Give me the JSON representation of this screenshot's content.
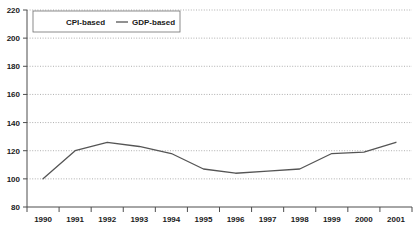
{
  "chart_data": {
    "type": "line",
    "title": "",
    "subtitle": "",
    "xlabel": "",
    "ylabel": "",
    "categories": [
      "1990",
      "1991",
      "1992",
      "1993",
      "1994",
      "1995",
      "1996",
      "1997",
      "1998",
      "1999",
      "2000",
      "2001"
    ],
    "x": [
      1990,
      1991,
      1992,
      1993,
      1994,
      1995,
      1996,
      1997,
      1998,
      1999,
      2000,
      2001
    ],
    "series": [
      {
        "name": "CPI-based",
        "color": "#ffffff",
        "visible_in_plot": false,
        "values": [
          null,
          null,
          null,
          null,
          null,
          null,
          null,
          null,
          null,
          null,
          null,
          null
        ]
      },
      {
        "name": "GDP-based",
        "color": "#555555",
        "visible_in_plot": true,
        "values": [
          100,
          120,
          126,
          123,
          118,
          107,
          104,
          105.5,
          107,
          118,
          119,
          126
        ]
      }
    ],
    "ylim": [
      80,
      220
    ],
    "yticks": [
      80,
      100,
      120,
      140,
      160,
      180,
      200,
      220
    ],
    "ytick_labels": [
      "80",
      "100",
      "120",
      "140",
      "160",
      "180",
      "200",
      "220"
    ],
    "xtick_labels": [
      "1990",
      "1991",
      "1992",
      "1993",
      "1994",
      "1995",
      "1996",
      "1997",
      "1998",
      "1999",
      "2000",
      "2001"
    ],
    "grid": "horizontal-dotted",
    "legend_position": "top-left",
    "legend_entries": [
      {
        "label": "CPI-based",
        "color": "#ffffff",
        "has_visible_marker": false
      },
      {
        "label": "GDP-based",
        "color": "#555555",
        "has_visible_marker": true
      }
    ],
    "plot_background": "#ffffff",
    "axis_color": "#4d4d4d",
    "gridline_color": "#8c8c8c"
  },
  "legend": {
    "entry_0_label": "CPI-based",
    "entry_1_label": "GDP-based"
  },
  "yaxis": {
    "label_0": "80",
    "label_1": "100",
    "label_2": "120",
    "label_3": "140",
    "label_4": "160",
    "label_5": "180",
    "label_6": "200",
    "label_7": "220"
  },
  "xaxis": {
    "label_0": "1990",
    "label_1": "1991",
    "label_2": "1992",
    "label_3": "1993",
    "label_4": "1994",
    "label_5": "1995",
    "label_6": "1996",
    "label_7": "1997",
    "label_8": "1998",
    "label_9": "1999",
    "label_10": "2000",
    "label_11": "2001"
  }
}
